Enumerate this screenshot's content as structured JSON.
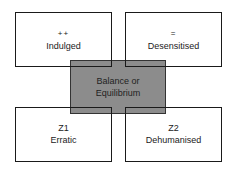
{
  "diagram": {
    "quadrants": {
      "top_left": {
        "symbol": "++",
        "label": "Indulged"
      },
      "top_right": {
        "symbol": "=",
        "label": "Desensitised"
      },
      "bottom_left": {
        "symbol": "Z1",
        "label": "Erratic"
      },
      "bottom_right": {
        "symbol": "Z2",
        "label": "Dehumanised"
      }
    },
    "center": {
      "line1": "Balance or",
      "line2": "Equilibrium"
    },
    "colors": {
      "center_fill": "#8c8c8c",
      "border": "#1a1a1a",
      "background": "#ffffff"
    }
  }
}
